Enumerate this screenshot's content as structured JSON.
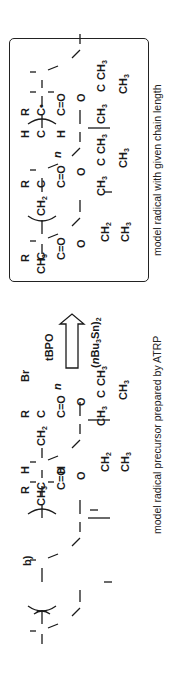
{
  "figure": {
    "panel_label": "b)",
    "left_structure": {
      "name": "model radical precursor",
      "caption": "model radical precursor prepared by ATRP",
      "end_group": "Br",
      "repeat_subscript": "n",
      "atoms": {
        "ch3_start": "CH3",
        "c1": "C",
        "r1": "R",
        "c1_carbonyl": "C=O",
        "o1": "O",
        "ch2_ethyl": "CH2",
        "ch3_ethyl": "CH3",
        "ch2_backbone": "CH2",
        "c2": "C",
        "r2": "R",
        "c2_carbonyl": "C=O",
        "o2": "O",
        "tbu_c": "C",
        "tbu_ch3_a": "CH3",
        "tbu_ch3_b": "CH3",
        "tbu_ch3_c": "CH3",
        "h_top": "H",
        "c3": "C",
        "h_bottom": "H",
        "c4": "C",
        "r3": "R",
        "c4_carbonyl": "C=O",
        "o3": "O",
        "tbu2_c": "C",
        "tbu2_ch3_a": "CH3",
        "tbu2_ch3_b": "CH3",
        "tbu2_ch3_c": "CH3"
      }
    },
    "reaction_arrow": {
      "reagent_above": "tBPO",
      "reagent_below": "(nBu3Sn)2",
      "direction": "right"
    },
    "right_structure": {
      "name": "model radical",
      "caption": "model radical with given chain length",
      "end_group": "radical dot",
      "repeat_subscript": "n",
      "boxed": true
    }
  }
}
